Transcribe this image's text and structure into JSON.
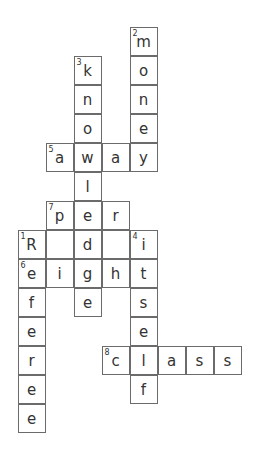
{
  "puzzle": {
    "cell_width": 28,
    "cell_height": 29,
    "origin_x": 18,
    "origin_y": 27,
    "cells": [
      {
        "r": 0,
        "c": 4,
        "letter": "m",
        "num": "2"
      },
      {
        "r": 1,
        "c": 4,
        "letter": "o"
      },
      {
        "r": 2,
        "c": 4,
        "letter": "n"
      },
      {
        "r": 3,
        "c": 4,
        "letter": "e"
      },
      {
        "r": 4,
        "c": 4,
        "letter": "y"
      },
      {
        "r": 1,
        "c": 2,
        "letter": "k",
        "num": "3"
      },
      {
        "r": 2,
        "c": 2,
        "letter": "n"
      },
      {
        "r": 3,
        "c": 2,
        "letter": "o"
      },
      {
        "r": 4,
        "c": 2,
        "letter": "w"
      },
      {
        "r": 5,
        "c": 2,
        "letter": "l"
      },
      {
        "r": 6,
        "c": 2,
        "letter": "e"
      },
      {
        "r": 7,
        "c": 2,
        "letter": "d"
      },
      {
        "r": 8,
        "c": 2,
        "letter": "g"
      },
      {
        "r": 9,
        "c": 2,
        "letter": "e"
      },
      {
        "r": 4,
        "c": 1,
        "letter": "a",
        "num": "5"
      },
      {
        "r": 4,
        "c": 3,
        "letter": "a"
      },
      {
        "r": 6,
        "c": 1,
        "letter": "p",
        "num": "7"
      },
      {
        "r": 6,
        "c": 3,
        "letter": "r"
      },
      {
        "r": 7,
        "c": 0,
        "letter": "R",
        "num": "1"
      },
      {
        "r": 7,
        "c": 1,
        "letter": ""
      },
      {
        "r": 7,
        "c": 3,
        "letter": ""
      },
      {
        "r": 7,
        "c": 4,
        "letter": "i",
        "num": "4"
      },
      {
        "r": 8,
        "c": 0,
        "letter": "e",
        "num": "6"
      },
      {
        "r": 8,
        "c": 1,
        "letter": "i"
      },
      {
        "r": 8,
        "c": 3,
        "letter": "h"
      },
      {
        "r": 8,
        "c": 4,
        "letter": "t"
      },
      {
        "r": 9,
        "c": 0,
        "letter": "f"
      },
      {
        "r": 9,
        "c": 4,
        "letter": "s"
      },
      {
        "r": 10,
        "c": 0,
        "letter": "e"
      },
      {
        "r": 10,
        "c": 4,
        "letter": "e"
      },
      {
        "r": 11,
        "c": 0,
        "letter": "r"
      },
      {
        "r": 11,
        "c": 3,
        "letter": "c",
        "num": "8"
      },
      {
        "r": 11,
        "c": 4,
        "letter": "l"
      },
      {
        "r": 11,
        "c": 5,
        "letter": "a"
      },
      {
        "r": 11,
        "c": 6,
        "letter": "s"
      },
      {
        "r": 11,
        "c": 7,
        "letter": "s"
      },
      {
        "r": 12,
        "c": 0,
        "letter": "e"
      },
      {
        "r": 12,
        "c": 4,
        "letter": "f"
      },
      {
        "r": 13,
        "c": 0,
        "letter": "e"
      }
    ],
    "words": {
      "across": [
        {
          "num": "5",
          "answer": "away"
        },
        {
          "num": "6",
          "answer": "eight"
        },
        {
          "num": "7",
          "answer": "per"
        },
        {
          "num": "8",
          "answer": "class"
        }
      ],
      "down": [
        {
          "num": "1",
          "answer": "Referee"
        },
        {
          "num": "2",
          "answer": "money"
        },
        {
          "num": "3",
          "answer": "knowledge"
        },
        {
          "num": "4",
          "answer": "itself"
        }
      ]
    }
  }
}
